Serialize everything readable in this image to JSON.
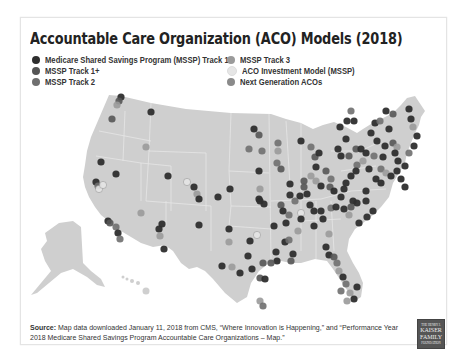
{
  "title": "Accountable Care Organization (ACO) Models (2018)",
  "legend": [
    {
      "label": "Medicare Shared Savings Program (MSSP) Track 1",
      "color": "#2e2e2e"
    },
    {
      "label": "MSSP Track 1+",
      "color": "#555555"
    },
    {
      "label": "MSSP Track 2",
      "color": "#6f6f6f"
    },
    {
      "label": "MSSP Track 3",
      "color": "#9a9a9a"
    },
    {
      "label": "ACO Investment Model (MSSP)",
      "color": "#e6e6e6"
    },
    {
      "label": "Next Generation ACOs",
      "color": "#8a8a8a"
    }
  ],
  "map": {
    "land_color": "#cfcfcf",
    "border_color": "#e8e8e8"
  },
  "source": {
    "prefix": "Source:",
    "text": " Map data downloaded January 11, 2018 from CMS, “Where Innovation is Happening,” and “Performance Year 2018 Medicare Shared Savings Program Accountable Care Organizations – Map.”"
  },
  "logo": {
    "line1": "THE HENRY J.",
    "line2": "KAISER",
    "line3": "FAMILY",
    "line4": "FOUNDATION"
  }
}
